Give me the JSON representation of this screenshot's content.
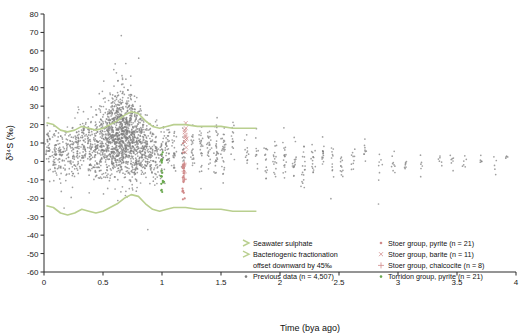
{
  "chart_data": {
    "type": "scatter",
    "title": "",
    "xlabel": "Time (bya ago)",
    "ylabel": "δ³⁴S (‰)",
    "xlim": [
      0,
      4
    ],
    "ylim": [
      -60,
      80
    ],
    "xticks": [
      "0",
      "0.5",
      "1",
      "1.5",
      "2",
      "2.5",
      "3",
      "3.5",
      "4"
    ],
    "yticks": [
      "80",
      "70",
      "60",
      "50",
      "40",
      "30",
      "20",
      "10",
      "0",
      "-10",
      "-20",
      "-30",
      "-40",
      "-50",
      "-60"
    ],
    "grid": false,
    "legend_position": "bottom",
    "series": [
      {
        "name": "Seawater sulphate",
        "marker": "line",
        "color": "#b9cf8f",
        "type": "curve",
        "points": [
          [
            0.02,
            21
          ],
          [
            0.08,
            20
          ],
          [
            0.14,
            17
          ],
          [
            0.2,
            16
          ],
          [
            0.26,
            17
          ],
          [
            0.32,
            19
          ],
          [
            0.38,
            18
          ],
          [
            0.44,
            17
          ],
          [
            0.5,
            18
          ],
          [
            0.56,
            20
          ],
          [
            0.62,
            22
          ],
          [
            0.68,
            25
          ],
          [
            0.74,
            27
          ],
          [
            0.8,
            26
          ],
          [
            0.86,
            22
          ],
          [
            0.92,
            19
          ],
          [
            0.98,
            18
          ],
          [
            1.04,
            19
          ],
          [
            1.1,
            20
          ],
          [
            1.2,
            20
          ],
          [
            1.3,
            19
          ],
          [
            1.4,
            19
          ],
          [
            1.5,
            19
          ],
          [
            1.6,
            18
          ],
          [
            1.7,
            18
          ],
          [
            1.8,
            18
          ]
        ]
      },
      {
        "name": "Bacteriogenic fractionation offset downward by 45‰",
        "marker": "line",
        "color": "#b9cf8f",
        "type": "curve",
        "points": [
          [
            0.02,
            -24
          ],
          [
            0.08,
            -25
          ],
          [
            0.14,
            -28
          ],
          [
            0.2,
            -29
          ],
          [
            0.26,
            -28
          ],
          [
            0.32,
            -26
          ],
          [
            0.38,
            -27
          ],
          [
            0.44,
            -28
          ],
          [
            0.5,
            -27
          ],
          [
            0.56,
            -25
          ],
          [
            0.62,
            -23
          ],
          [
            0.68,
            -20
          ],
          [
            0.74,
            -18
          ],
          [
            0.8,
            -19
          ],
          [
            0.86,
            -23
          ],
          [
            0.92,
            -26
          ],
          [
            0.98,
            -27
          ],
          [
            1.04,
            -26
          ],
          [
            1.1,
            -25
          ],
          [
            1.2,
            -25
          ],
          [
            1.3,
            -26
          ],
          [
            1.4,
            -26
          ],
          [
            1.5,
            -26
          ],
          [
            1.6,
            -27
          ],
          [
            1.7,
            -27
          ],
          [
            1.8,
            -27
          ]
        ]
      },
      {
        "name": "Previous data (n = 4,507)",
        "marker": "dot",
        "color": "#808080",
        "n": 4507
      },
      {
        "name": "Stoer group, pyrite (n = 21)",
        "marker": "dot",
        "color": "#d08a8a",
        "n": 21
      },
      {
        "name": "Stoer group, barite (n = 11)",
        "marker": "cross",
        "color": "#d08a8a",
        "n": 11
      },
      {
        "name": "Stoer group, chalcocite (n = 8)",
        "marker": "plus",
        "color": "#d08a8a",
        "n": 8
      },
      {
        "name": "Torridon group, pyrite (n = 21)",
        "marker": "dot",
        "color": "#6aa84f",
        "n": 21
      }
    ],
    "annotations": []
  },
  "legend": {
    "col1": [
      "Seawater sulphate",
      "Bacteriogenic fractionation",
      "offset downward by 45‰",
      "Previous data (n = 4,507)"
    ],
    "col2": [
      "Stoer group, pyrite (n = 21)",
      "Stoer group, barite (n = 11)",
      "Stoer group, chalcocite (n = 8)",
      "Torridon group, pyrite (n = 21)"
    ]
  }
}
